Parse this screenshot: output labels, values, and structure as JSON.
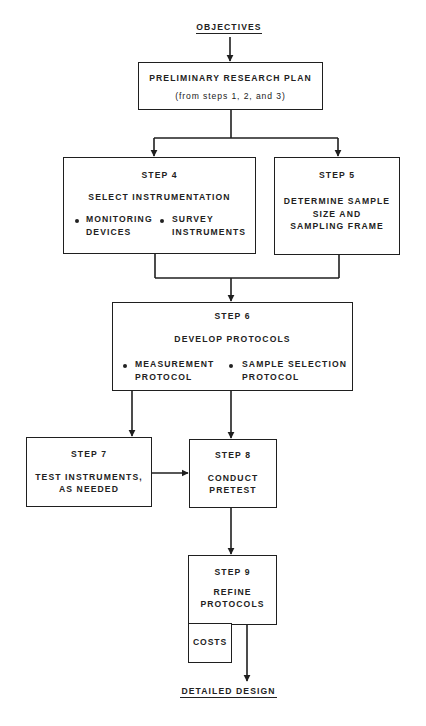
{
  "diagram": {
    "type": "flowchart",
    "start": {
      "label": "OBJECTIVES"
    },
    "end": {
      "label": "DETAILED DESIGN"
    },
    "nodes": [
      {
        "id": "prelim",
        "title": "PRELIMINARY RESEARCH PLAN",
        "subtitle": "(from steps 1, 2, and 3)"
      },
      {
        "id": "step4",
        "step": "STEP 4",
        "title": "SELECT INSTRUMENTATION",
        "bullets": [
          "MONITORING DEVICES",
          "SURVEY INSTRUMENTS"
        ],
        "bullet_lines": [
          [
            "MONITORING",
            "DEVICES"
          ],
          [
            "SURVEY",
            "INSTRUMENTS"
          ]
        ]
      },
      {
        "id": "step5",
        "step": "STEP 5",
        "title_lines": [
          "DETERMINE SAMPLE",
          "SIZE AND",
          "SAMPLING FRAME"
        ]
      },
      {
        "id": "step6",
        "step": "STEP 6",
        "title": "DEVELOP PROTOCOLS",
        "bullets": [
          "MEASUREMENT PROTOCOL",
          "SAMPLE SELECTION PROTOCOL"
        ],
        "bullet_lines": [
          [
            "MEASUREMENT",
            "PROTOCOL"
          ],
          [
            "SAMPLE SELECTION",
            "PROTOCOL"
          ]
        ]
      },
      {
        "id": "step7",
        "step": "STEP 7",
        "title_lines": [
          "TEST INSTRUMENTS,",
          "AS NEEDED"
        ]
      },
      {
        "id": "step8",
        "step": "STEP 8",
        "title_lines": [
          "CONDUCT",
          "PRETEST"
        ]
      },
      {
        "id": "step9",
        "step": "STEP 9",
        "title_lines": [
          "REFINE",
          "PROTOCOLS"
        ]
      },
      {
        "id": "costs",
        "title": "COSTS"
      }
    ],
    "edges": [
      [
        "OBJECTIVES",
        "prelim"
      ],
      [
        "prelim",
        "step4"
      ],
      [
        "prelim",
        "step5"
      ],
      [
        "step4",
        "step6"
      ],
      [
        "step5",
        "step6"
      ],
      [
        "step6",
        "step7"
      ],
      [
        "step6",
        "step8"
      ],
      [
        "step7",
        "step8"
      ],
      [
        "step8",
        "step9"
      ],
      [
        "step9",
        "DETAILED DESIGN"
      ]
    ],
    "colors": {
      "line": "#1f1f1f",
      "text": "#222222",
      "background": "#ffffff"
    }
  }
}
